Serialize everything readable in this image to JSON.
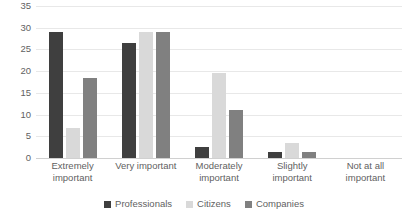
{
  "chart_data": {
    "type": "bar",
    "title": "",
    "xlabel": "",
    "ylabel": "",
    "ylim": [
      0,
      35
    ],
    "yticks": [
      0,
      5,
      10,
      15,
      20,
      25,
      30,
      35
    ],
    "grid": true,
    "legend_position": "bottom",
    "categories": [
      "Extremely important",
      "Very important",
      "Moderately important",
      "Slightly important",
      "Not at all important"
    ],
    "series": [
      {
        "name": "Professionals",
        "color": "#3f3f3f",
        "values": [
          29,
          26.5,
          2.5,
          1.5,
          0
        ]
      },
      {
        "name": "Citizens",
        "color": "#d9d9d9",
        "values": [
          7,
          29,
          19.5,
          3.5,
          0
        ]
      },
      {
        "name": "Companies",
        "color": "#808080",
        "values": [
          18.5,
          29,
          11,
          1.5,
          0
        ]
      }
    ]
  }
}
